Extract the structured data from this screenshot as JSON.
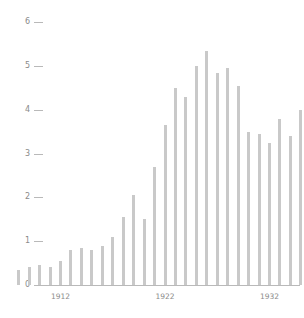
{
  "chart_data": {
    "type": "bar",
    "title": "",
    "xlabel": "",
    "ylabel": "",
    "xlim": [
      1907.5,
      1938.5
    ],
    "ylim": [
      0,
      6.2
    ],
    "grid": false,
    "legend": null,
    "y_ticks": [
      0,
      1,
      2,
      3,
      4,
      5,
      6
    ],
    "y_tick_labels": [
      "0",
      "1",
      "2",
      "3",
      "4",
      "5",
      "6"
    ],
    "x_ticks": [
      1912,
      1922,
      1932
    ],
    "x_tick_labels": [
      "1912",
      "1922",
      "1932"
    ],
    "bar_color": "#c9c9c9",
    "axis_color": "#b9b9b9",
    "tick_text_color": "#8a8a8a",
    "categories": [
      1908,
      1909,
      1910,
      1911,
      1912,
      1913,
      1914,
      1915,
      1916,
      1917,
      1918,
      1919,
      1920,
      1921,
      1922,
      1923,
      1924,
      1925,
      1926,
      1927,
      1928,
      1929,
      1930,
      1931,
      1932,
      1933,
      1934,
      1935,
      1936,
      1937,
      1938
    ],
    "values": [
      0.35,
      0.4,
      0.45,
      0.4,
      0.55,
      0.8,
      0.85,
      0.8,
      0.9,
      1.1,
      1.55,
      2.05,
      1.5,
      2.7,
      3.65,
      4.5,
      4.3,
      5.0,
      5.35,
      4.85,
      4.95,
      4.55,
      3.5,
      3.45,
      3.25,
      3.8,
      3.4,
      4.0,
      5.45,
      5.6,
      5.2
    ]
  }
}
